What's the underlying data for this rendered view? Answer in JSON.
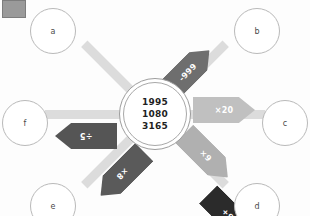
{
  "diagram": {
    "title_box": "legend-swatch",
    "center": {
      "values": [
        "1995",
        "1080",
        "3165"
      ]
    },
    "nodes": [
      {
        "id": "a",
        "label": "a",
        "position": "top-left"
      },
      {
        "id": "b",
        "label": "b",
        "position": "top-right"
      },
      {
        "id": "c",
        "label": "c",
        "position": "right"
      },
      {
        "id": "d",
        "label": "d",
        "position": "bottom-right"
      },
      {
        "id": "e",
        "label": "e",
        "position": "bottom-left"
      },
      {
        "id": "f",
        "label": "f",
        "position": "left"
      }
    ],
    "edges": [
      {
        "to": "a",
        "label": "+90",
        "color": "#2b2b2b",
        "angle": -135
      },
      {
        "to": "b",
        "label": "-999",
        "color": "#6e6e6e",
        "angle": -45
      },
      {
        "to": "c",
        "label": "×20",
        "color": "#c0c0c0",
        "angle": 0
      },
      {
        "to": "d",
        "label": "×9",
        "color": "#b0b0b0",
        "angle": 45
      },
      {
        "to": "e",
        "label": "×8",
        "color": "#5a5a5a",
        "angle": 135
      },
      {
        "to": "f",
        "label": "÷5",
        "color": "#555555",
        "angle": 180
      }
    ],
    "colors": {
      "background": "#fdfdfd",
      "shaft": "#dcdcdc",
      "node_border": "#b9b9b9",
      "center_border": "#9d9d9d",
      "corner_box": "#9a9a9a"
    }
  }
}
